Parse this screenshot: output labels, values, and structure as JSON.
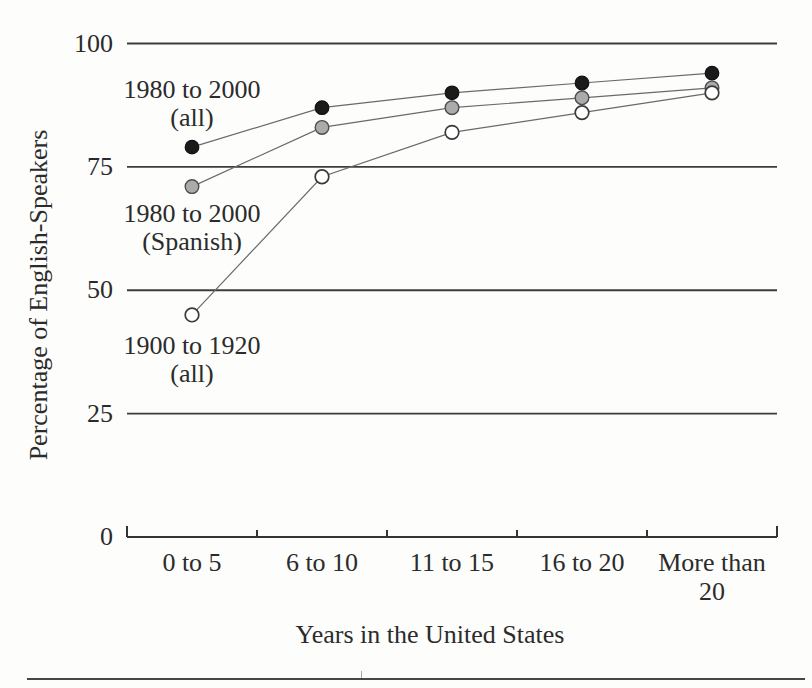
{
  "figure": {
    "kind": "scanned book figure",
    "bottom_rule": true
  },
  "colors": {
    "background": "#fdfdfc",
    "text": "#2b2b2b",
    "gridline": "#3c3c3c",
    "axis": "#343434",
    "series_line": "#6a6a6a",
    "marker_black_fill": "#1b1b1b",
    "marker_black_stroke": "#111111",
    "marker_gray_fill": "#ababab",
    "marker_gray_stroke": "#4d4d4d",
    "marker_white_fill": "#ffffff",
    "marker_white_stroke": "#3a3a3a"
  },
  "chart_data": {
    "type": "line",
    "title": "",
    "xlabel": "Years in the United States",
    "ylabel": "Percentage of English-Speakers",
    "categories": [
      "0 to 5",
      "6 to 10",
      "11 to 15",
      "16 to 20",
      "More than 20"
    ],
    "series": [
      {
        "name": "1980 to 2000 (all)",
        "marker": "black",
        "values": [
          79,
          87,
          90,
          92,
          94
        ]
      },
      {
        "name": "1980 to 2000 (Spanish)",
        "marker": "gray",
        "values": [
          71,
          83,
          87,
          89,
          91
        ]
      },
      {
        "name": "1900 to 1920 (all)",
        "marker": "white",
        "values": [
          45,
          73,
          82,
          86,
          90
        ]
      }
    ],
    "ylim": [
      0,
      100
    ],
    "yticks": [
      100,
      75,
      50,
      25,
      0
    ],
    "grid": "horizontal",
    "legend_position": "inline annotations next to first data points",
    "annotations": [
      {
        "lines": [
          "1980 to 2000",
          "(all)"
        ],
        "series": "1980 to 2000 (all)"
      },
      {
        "lines": [
          "1980 to 2000",
          "(Spanish)"
        ],
        "series": "1980 to 2000 (Spanish)"
      },
      {
        "lines": [
          "1900 to 1920",
          "(all)"
        ],
        "series": "1900 to 1920 (all)"
      }
    ]
  }
}
